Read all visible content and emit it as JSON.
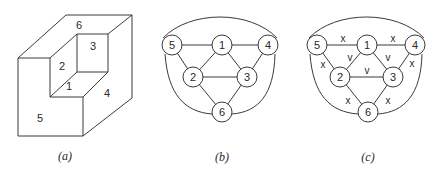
{
  "panels": {
    "a": {
      "caption": "(a)",
      "faces": [
        {
          "id": "1",
          "label": "1",
          "x": 69,
          "y": 86
        },
        {
          "id": "2",
          "label": "2",
          "x": 62,
          "y": 66
        },
        {
          "id": "3",
          "label": "3",
          "x": 93,
          "y": 46
        },
        {
          "id": "4",
          "label": "4",
          "x": 107,
          "y": 93
        },
        {
          "id": "5",
          "label": "5",
          "x": 40,
          "y": 118
        },
        {
          "id": "6",
          "label": "6",
          "x": 79,
          "y": 25
        }
      ]
    },
    "b": {
      "caption": "(b)",
      "nodes": {
        "n1": "1",
        "n2": "2",
        "n3": "3",
        "n4": "4",
        "n5": "5",
        "n6": "6"
      }
    },
    "c": {
      "caption": "(c)",
      "nodes": {
        "n1": "1",
        "n2": "2",
        "n3": "3",
        "n4": "4",
        "n5": "5",
        "n6": "6"
      },
      "edge_labels": {
        "e51": "x",
        "e14": "x",
        "e12": "v",
        "e13": "v",
        "e52": "x",
        "e43": "x",
        "e23": "v",
        "e26": "x",
        "e36": "x"
      }
    }
  },
  "graph": {
    "edges": [
      [
        "5",
        "1"
      ],
      [
        "1",
        "4"
      ],
      [
        "5",
        "2"
      ],
      [
        "1",
        "2"
      ],
      [
        "1",
        "3"
      ],
      [
        "4",
        "3"
      ],
      [
        "2",
        "3"
      ],
      [
        "2",
        "6"
      ],
      [
        "3",
        "6"
      ],
      [
        "5",
        "4"
      ],
      [
        "5",
        "6"
      ],
      [
        "4",
        "6"
      ]
    ]
  },
  "colors": {
    "stroke": "#3a3a3a",
    "background": "#ffffff"
  }
}
